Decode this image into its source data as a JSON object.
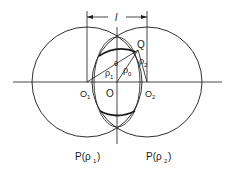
{
  "diagram": {
    "type": "geometry",
    "labels": {
      "dimension": "l",
      "O1": "O",
      "O1_sub": "1",
      "O": "O",
      "O2": "O",
      "O2_sub": "2",
      "Q": "Q",
      "rho1": "ρ",
      "rho1_sub": "1",
      "rho2": "ρ",
      "rho2_sub": "2",
      "rho0": "ρ",
      "rho0_sub": "0",
      "theta": "θ",
      "circle1": "P(ρ",
      "circle1_sub": "1",
      "circle1_close": ")",
      "circle2": "P(ρ",
      "circle2_sub": "2",
      "circle2_close": ")"
    },
    "colors": {
      "stroke": "#1a1a1a",
      "background": "#ffffff"
    }
  }
}
